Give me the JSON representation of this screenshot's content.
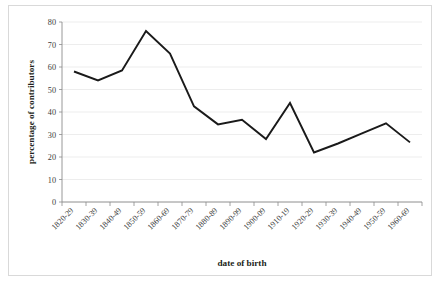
{
  "chart_data": {
    "type": "line",
    "title": "",
    "xlabel": "date of birth",
    "ylabel": "percentage of contributors",
    "ylim": [
      0,
      80
    ],
    "ytick_step": 10,
    "yticks": [
      0,
      10,
      20,
      30,
      40,
      50,
      60,
      70,
      80
    ],
    "grid": true,
    "legend": "none",
    "line_color": "#1a1a1a",
    "categories": [
      "1820-29",
      "1830-39",
      "1840-49",
      "1850-59",
      "1860-69",
      "1870-79",
      "1880-89",
      "1890-99",
      "1900-09",
      "1910-19",
      "1920-29",
      "1930-39",
      "1940-49",
      "1950-59",
      "1960-69"
    ],
    "series": [
      {
        "name": "percentage of contributors",
        "values": [
          58,
          54,
          58.5,
          76,
          66,
          42.5,
          34.5,
          36.5,
          28,
          44,
          22,
          26,
          30.5,
          35,
          26.5
        ]
      }
    ]
  },
  "axis": {
    "x_title": "date of birth",
    "y_title": "percentage of contributors"
  }
}
